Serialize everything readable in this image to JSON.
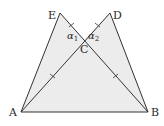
{
  "diagram": {
    "type": "geometry",
    "fill_color": "#ececec",
    "stroke_color": "#333333",
    "points": {
      "A": {
        "label": "A",
        "x": 21,
        "y": 112
      },
      "B": {
        "label": "B",
        "x": 148,
        "y": 112
      },
      "C": {
        "label": "C",
        "x": 84,
        "y": 40
      },
      "D": {
        "label": "D",
        "x": 110,
        "y": 13
      },
      "E": {
        "label": "E",
        "x": 60,
        "y": 13
      }
    },
    "angles": {
      "alpha1": {
        "symbol": "α",
        "subscript": "1"
      },
      "alpha2": {
        "symbol": "α",
        "subscript": "2"
      }
    },
    "segments": [
      "AB",
      "AE",
      "BD",
      "AD",
      "BE"
    ],
    "equal_marks": [
      "EC",
      "DC",
      "AC",
      "BC"
    ]
  }
}
